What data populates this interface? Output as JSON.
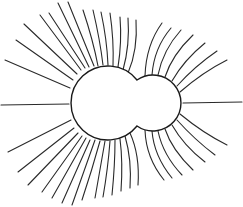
{
  "diagram": {
    "title": "",
    "colors": {
      "line": "#2a2a2a",
      "outline": "#1a1a1a",
      "background": "#ffffff"
    },
    "large_circle": {
      "cx": 105,
      "cy": 103,
      "r": 37
    },
    "small_circle": {
      "cx": 155,
      "cy": 103,
      "r": 28
    },
    "field_lines": {
      "upper_left_count": 14,
      "upper_right_count": 7,
      "lower_left_count": 14,
      "lower_right_count": 7,
      "horizontal_left": true,
      "horizontal_right": true
    }
  }
}
